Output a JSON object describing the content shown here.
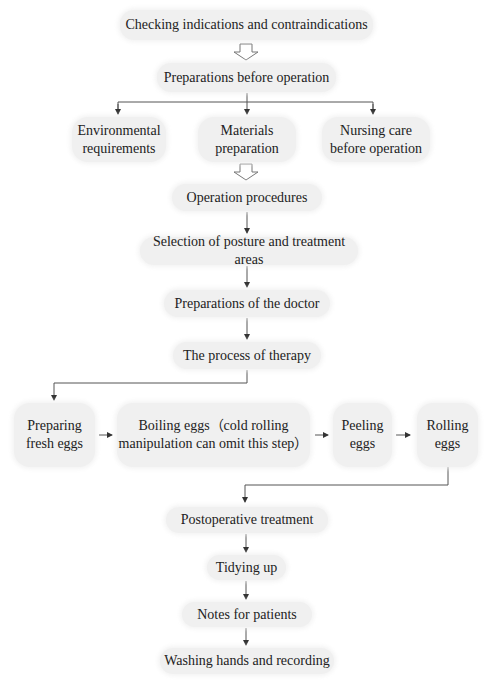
{
  "diagram": {
    "type": "flowchart",
    "colors": {
      "node_fill": "#f0f0f0",
      "line": "#444444",
      "text": "#222222"
    },
    "nodes": {
      "checking": "Checking indications and contraindications",
      "prep_before": "Preparations before operation",
      "env_req_1": "Environmental",
      "env_req_2": "requirements",
      "materials_1": "Materials",
      "materials_2": "preparation",
      "nursing_1": "Nursing care",
      "nursing_2": "before operation",
      "op_procedures": "Operation procedures",
      "selection": "Selection of posture and treatment areas",
      "prep_doctor": "Preparations of the doctor",
      "process": "The process of therapy",
      "prep_eggs_1": "Preparing",
      "prep_eggs_2": "fresh eggs",
      "boiling_1": "Boiling eggs（cold rolling",
      "boiling_2": "manipulation can omit this step）",
      "peeling_1": "Peeling",
      "peeling_2": "eggs",
      "rolling_1": "Rolling",
      "rolling_2": "eggs",
      "postop": "Postoperative treatment",
      "tidying": "Tidying up",
      "notes": "Notes for patients",
      "washing": "Washing hands and recording"
    },
    "edges": [
      {
        "from": "checking",
        "to": "prep_before",
        "style": "hollow-arrow"
      },
      {
        "from": "prep_before",
        "to": "env_req",
        "style": "arrow"
      },
      {
        "from": "prep_before",
        "to": "materials",
        "style": "arrow"
      },
      {
        "from": "prep_before",
        "to": "nursing",
        "style": "arrow"
      },
      {
        "from": "materials",
        "to": "op_procedures",
        "style": "hollow-arrow"
      },
      {
        "from": "op_procedures",
        "to": "selection",
        "style": "arrow"
      },
      {
        "from": "selection",
        "to": "prep_doctor",
        "style": "arrow"
      },
      {
        "from": "prep_doctor",
        "to": "process",
        "style": "arrow"
      },
      {
        "from": "process",
        "to": "prep_eggs",
        "style": "arrow"
      },
      {
        "from": "prep_eggs",
        "to": "boiling",
        "style": "arrow"
      },
      {
        "from": "boiling",
        "to": "peeling",
        "style": "arrow"
      },
      {
        "from": "peeling",
        "to": "rolling",
        "style": "arrow"
      },
      {
        "from": "rolling",
        "to": "postop",
        "style": "arrow"
      },
      {
        "from": "postop",
        "to": "tidying",
        "style": "arrow"
      },
      {
        "from": "tidying",
        "to": "notes",
        "style": "arrow"
      },
      {
        "from": "notes",
        "to": "washing",
        "style": "arrow"
      }
    ]
  }
}
